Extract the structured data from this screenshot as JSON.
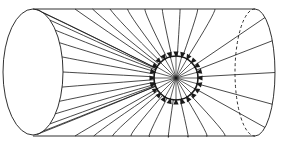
{
  "diagram": {
    "title": "",
    "colors": {
      "stroke": "#1a1a1a",
      "background": "#ffffff"
    },
    "cylinder": {
      "left_ellipse": {
        "cx": 33,
        "cy": 72,
        "rx": 30,
        "ry": 63
      },
      "top_y": 9,
      "bottom_y": 136,
      "right_x": 255,
      "right_cap_rx": 20,
      "back_dashed_x": 232
    },
    "sink": {
      "cx": 176,
      "cy": 78,
      "r": 22,
      "arrow_count": 24,
      "radial_line_count": 24
    },
    "left_field_line_count": 13,
    "top_field_line_count": 9,
    "bottom_field_line_count": 9,
    "right_field_line_count": 5
  }
}
